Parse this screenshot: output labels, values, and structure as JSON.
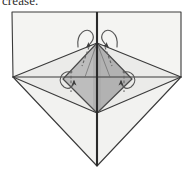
{
  "figure": {
    "kind": "origami-folding-diagram",
    "caption_fragment": "crease.",
    "background_color": "#ffffff",
    "line_color": "#3a3a3a",
    "dashed_line_color": "#6e6e6e",
    "arrow_color": "#555555"
  },
  "palette": {
    "paper_top_panel": "#f4f4f2",
    "paper_left_wing": "#efefed",
    "paper_right_wing": "#efefed",
    "paper_lower_triangle": "#f1f1ef",
    "paper_mid_band": "#e9e9e7",
    "inner_kite_left": "#b9b9b9",
    "inner_kite_right": "#b0b0b0",
    "inner_kite_core": "#a9a9a9",
    "spine_dark": "#2a2a2a",
    "outline": "#3a3a3a"
  },
  "geometry": {
    "canvas": {
      "width": 192,
      "height": 175
    },
    "points": {
      "top_left": [
        12,
        12
      ],
      "top_right": [
        181,
        12
      ],
      "left_vertex": [
        13,
        77
      ],
      "right_vertex": [
        181,
        77
      ],
      "top_center": [
        97,
        12
      ],
      "center": [
        97,
        77
      ],
      "bottom_vertex": [
        97,
        166
      ],
      "kite_top": [
        97,
        43
      ],
      "kite_left": [
        63,
        79
      ],
      "kite_right": [
        132,
        79
      ],
      "kite_bottom": [
        97,
        113
      ]
    },
    "solid_edges": [
      {
        "name": "top-panel-top-edge",
        "from": "top_left",
        "to": "top_right"
      },
      {
        "name": "top-panel-left-edge",
        "from": "top_left",
        "to": "left_vertex"
      },
      {
        "name": "top-panel-right-edge",
        "from": "top_right",
        "to": "right_vertex"
      },
      {
        "name": "horizontal-midline-left",
        "from": "left_vertex",
        "to": "center"
      },
      {
        "name": "horizontal-midline-right",
        "from": "center",
        "to": "right_vertex"
      },
      {
        "name": "lower-left-edge",
        "from": "left_vertex",
        "to": "bottom_vertex"
      },
      {
        "name": "lower-right-edge",
        "from": "right_vertex",
        "to": "bottom_vertex"
      },
      {
        "name": "vertical-spine",
        "from": "top_center",
        "to": "bottom_vertex"
      },
      {
        "name": "kite-upper-left",
        "from": "kite_top",
        "to": "kite_left"
      },
      {
        "name": "kite-upper-right",
        "from": "kite_top",
        "to": "kite_right"
      },
      {
        "name": "kite-lower-left",
        "from": "kite_left",
        "to": "kite_bottom"
      },
      {
        "name": "kite-lower-right",
        "from": "kite_right",
        "to": "kite_bottom"
      },
      {
        "name": "diag-left-down",
        "from": "left_vertex",
        "to": "kite_bottom"
      },
      {
        "name": "diag-right-down",
        "from": "right_vertex",
        "to": "kite_bottom"
      },
      {
        "name": "diag-left-up",
        "from": "left_vertex",
        "to": "kite_top"
      },
      {
        "name": "diag-right-up",
        "from": "right_vertex",
        "to": "kite_top"
      }
    ],
    "dashed_creases": [
      {
        "name": "crease-upper-left",
        "from": [
          88,
          47
        ],
        "to": [
          80,
          66
        ]
      },
      {
        "name": "crease-upper-right",
        "from": [
          106,
          47
        ],
        "to": [
          114,
          66
        ]
      },
      {
        "name": "crease-lower-left",
        "from": [
          71,
          72
        ],
        "to": [
          71,
          92
        ]
      },
      {
        "name": "crease-lower-right",
        "from": [
          124,
          72
        ],
        "to": [
          124,
          92
        ]
      }
    ],
    "fold_arrows": [
      {
        "name": "fold-arrow-top-left",
        "curl_center": [
          86,
          37
        ],
        "points_to": [
          92,
          50
        ],
        "direction": "down-right"
      },
      {
        "name": "fold-arrow-top-right",
        "curl_center": [
          109,
          37
        ],
        "points_to": [
          103,
          50
        ],
        "direction": "down-left"
      },
      {
        "name": "fold-arrow-bottom-left",
        "curl_center": [
          67,
          83
        ],
        "points_to": [
          74,
          76
        ],
        "direction": "up-right"
      },
      {
        "name": "fold-arrow-bottom-right",
        "curl_center": [
          128,
          83
        ],
        "points_to": [
          121,
          76
        ],
        "direction": "up-left"
      }
    ]
  }
}
